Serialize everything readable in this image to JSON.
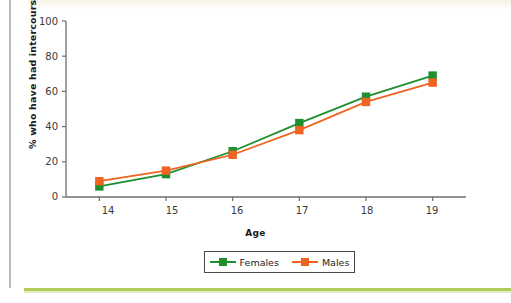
{
  "page": {
    "background_color": "#ffffff",
    "accent_rule_color": "#b0cb5a",
    "gutter_rule_color": "#bdbdbd"
  },
  "chart_data": {
    "type": "line",
    "title": "",
    "xlabel": "Age",
    "ylabel": "% who have had intercourse, 2002",
    "categories": [
      "14",
      "15",
      "16",
      "17",
      "18",
      "19"
    ],
    "x": [
      14,
      15,
      16,
      17,
      18,
      19
    ],
    "xlim": [
      13.5,
      19.5
    ],
    "ylim": [
      0,
      100
    ],
    "yticks": [
      0,
      20,
      40,
      60,
      80,
      100
    ],
    "xticks": [
      14,
      15,
      16,
      17,
      18,
      19
    ],
    "grid": false,
    "legend_position": "bottom-center",
    "series": [
      {
        "name": "Females",
        "color": "#1e8f2e",
        "marker": "square",
        "values": [
          6,
          13,
          26,
          42,
          57,
          69
        ]
      },
      {
        "name": "Males",
        "color": "#ef6421",
        "marker": "square",
        "values": [
          9,
          15,
          24,
          38,
          54,
          65
        ]
      }
    ]
  },
  "axis": {
    "y_title": "% who have had intercourse, 2002",
    "x_title": "Age",
    "y_tick_labels": [
      "100",
      "80",
      "60",
      "40",
      "20",
      "0"
    ],
    "x_tick_labels": [
      "14",
      "15",
      "16",
      "17",
      "18",
      "19"
    ]
  },
  "legend": {
    "items": [
      {
        "label": "Females",
        "color": "#1e8f2e"
      },
      {
        "label": "Males",
        "color": "#ef6421"
      }
    ]
  }
}
